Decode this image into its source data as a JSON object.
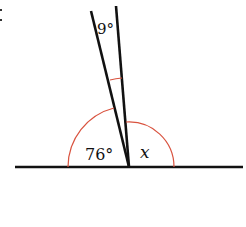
{
  "diagram": {
    "type": "geometry-angles",
    "labels": {
      "small_angle": "9°",
      "left_angle": "76°",
      "unknown_angle": "x"
    },
    "colors": {
      "line": "#111111",
      "arc": "#d9533f",
      "background": "#ffffff"
    },
    "geometry": {
      "vertex": [
        129,
        167
      ],
      "baseline": {
        "x1": 15,
        "x2": 243,
        "y": 167
      },
      "left_ray_end": [
        91,
        11
      ],
      "right_ray_end": [
        116,
        6
      ]
    }
  }
}
